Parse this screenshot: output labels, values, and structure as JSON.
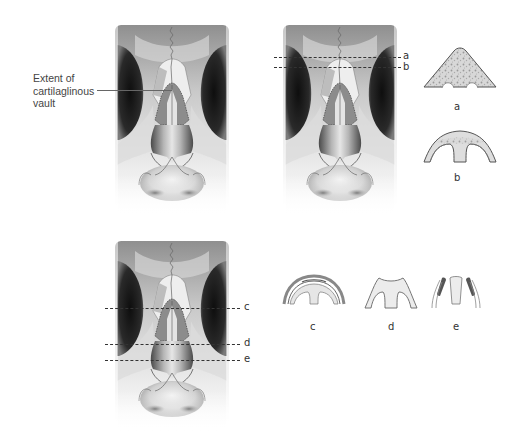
{
  "figures": {
    "top_left": {
      "callout": {
        "line1": "Extent of",
        "line2": "cartilaglinous",
        "line3": "vault"
      }
    },
    "top_right": {
      "section_lines": [
        {
          "label": "a"
        },
        {
          "label": "b"
        }
      ],
      "cross_sections": [
        {
          "label": "a"
        },
        {
          "label": "b"
        }
      ]
    },
    "bottom_left": {
      "section_lines": [
        {
          "label": "c"
        },
        {
          "label": "d"
        },
        {
          "label": "e"
        }
      ]
    },
    "bottom_right": {
      "cross_sections": [
        {
          "label": "c"
        },
        {
          "label": "d"
        },
        {
          "label": "e"
        }
      ]
    }
  },
  "colors": {
    "bone_light": "#e8e8e8",
    "bone_dark": "#6b6b6b",
    "orbit": "#1c1c1c",
    "cartilage": "#8a8a8a",
    "line": "#333333"
  }
}
